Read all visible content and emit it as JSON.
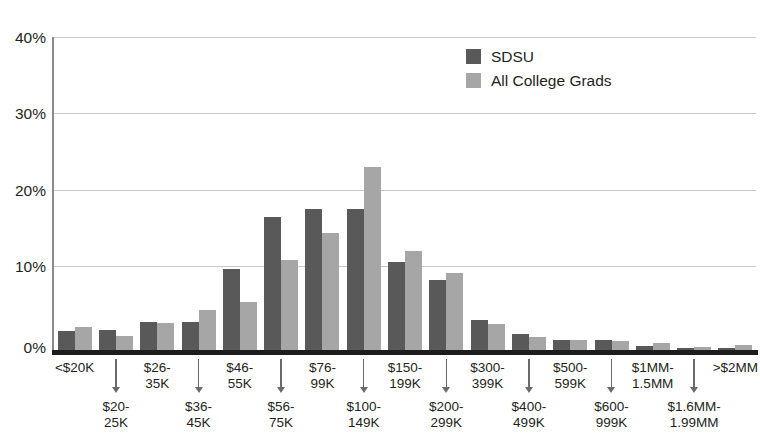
{
  "chart_data": {
    "type": "bar",
    "title": "",
    "xlabel": "",
    "ylabel": "",
    "ylim": [
      0,
      40
    ],
    "yticks": [
      "0%",
      "10%",
      "20%",
      "30%",
      "40%"
    ],
    "ytick_values": [
      0,
      10,
      20,
      30,
      40
    ],
    "grid": true,
    "legend_position": "top-center",
    "categories": [
      "<$20K",
      "$20-25K",
      "$26-35K",
      "$36-45K",
      "$46-55K",
      "$56-75K",
      "$76-99K",
      "$100-149K",
      "$150-199K",
      "$200-299K",
      "$300-399K",
      "$400-499K",
      "$500-599K",
      "$600-999K",
      "$1MM-1.5MM",
      "$1.6MM-1.99MM",
      ">$2MM"
    ],
    "category_labels_top": [
      "<$20K",
      "$26-\n35K",
      "$46-\n55K",
      "$76-\n99K",
      "$150-\n199K",
      "$300-\n399K",
      "$500-\n599K",
      "$1MM-\n1.5MM",
      ">$2MM"
    ],
    "category_labels_bottom": [
      "$20-\n25K",
      "$36-\n45K",
      "$56-\n75K",
      "$100-\n149K",
      "$200-\n299K",
      "$400-\n499K",
      "$600-\n999K",
      "$1.6MM-\n1.99MM"
    ],
    "series": [
      {
        "name": "SDSU",
        "color": "#595959",
        "values": [
          2.4,
          2.5,
          3.6,
          3.6,
          10.4,
          17.0,
          18.0,
          18.0,
          11.3,
          8.9,
          3.8,
          2.1,
          1.3,
          1.3,
          0.5,
          0.3,
          0.3
        ]
      },
      {
        "name": "All College Grads",
        "color": "#a6a6a6",
        "values": [
          3.0,
          1.8,
          3.5,
          5.1,
          6.2,
          11.5,
          15.0,
          23.4,
          12.6,
          9.8,
          3.3,
          1.6,
          1.3,
          1.2,
          0.9,
          0.4,
          0.6
        ]
      }
    ]
  },
  "legend": {
    "items": [
      {
        "label": "SDSU",
        "color": "#595959"
      },
      {
        "label": "All College Grads",
        "color": "#a6a6a6"
      }
    ]
  },
  "axis": {
    "y_labels": [
      "40%",
      "30%",
      "20%",
      "10%",
      "0%"
    ]
  },
  "xaxis": {
    "top_labels": [
      {
        "index": 0,
        "line1": "<$20K",
        "line2": ""
      },
      {
        "index": 2,
        "line1": "$26-",
        "line2": "35K"
      },
      {
        "index": 4,
        "line1": "$46-",
        "line2": "55K"
      },
      {
        "index": 6,
        "line1": "$76-",
        "line2": "99K"
      },
      {
        "index": 8,
        "line1": "$150-",
        "line2": "199K"
      },
      {
        "index": 10,
        "line1": "$300-",
        "line2": "399K"
      },
      {
        "index": 12,
        "line1": "$500-",
        "line2": "599K"
      },
      {
        "index": 14,
        "line1": "$1MM-",
        "line2": "1.5MM"
      },
      {
        "index": 16,
        "line1": ">$2MM",
        "line2": ""
      }
    ],
    "bottom_labels": [
      {
        "index": 1,
        "line1": "$20-",
        "line2": "25K"
      },
      {
        "index": 3,
        "line1": "$36-",
        "line2": "45K"
      },
      {
        "index": 5,
        "line1": "$56-",
        "line2": "75K"
      },
      {
        "index": 7,
        "line1": "$100-",
        "line2": "149K"
      },
      {
        "index": 9,
        "line1": "$200-",
        "line2": "299K"
      },
      {
        "index": 11,
        "line1": "$400-",
        "line2": "499K"
      },
      {
        "index": 13,
        "line1": "$600-",
        "line2": "999K"
      },
      {
        "index": 15,
        "line1": "$1.6MM-",
        "line2": "1.99MM"
      }
    ]
  },
  "colors": {
    "sdsu": "#595959",
    "all_college_grads": "#a6a6a6",
    "gridline": "#c9c9c9",
    "axis": "#1d1d1d",
    "text": "#231f20",
    "background": "#ffffff"
  }
}
